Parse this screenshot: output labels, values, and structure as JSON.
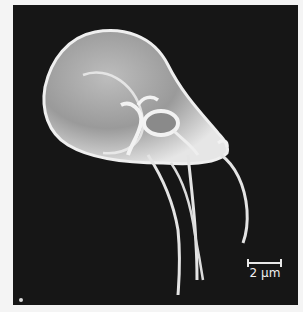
{
  "image": {
    "subject": "SEM micrograph of a flagellated protozoan (Giardia trophozoite)",
    "background_color": "#161616",
    "frame_color": "#f4f4f4",
    "cell_color": "#d9d9d9"
  },
  "scale_bar": {
    "label": "2 µm"
  }
}
